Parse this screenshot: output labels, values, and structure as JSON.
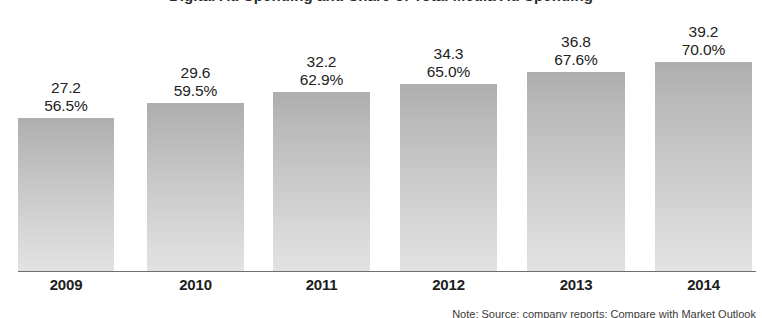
{
  "chart_data": {
    "type": "bar",
    "title": "Digital Ad Spending and Share of Total Media Ad Spending",
    "footnote": "Note: Source: company reports; Compare with Market Outlook",
    "categories": [
      "2009",
      "2010",
      "2011",
      "2012",
      "2013",
      "2014"
    ],
    "series": [
      {
        "name": "Spending",
        "values": [
          27.2,
          29.6,
          32.2,
          34.3,
          36.8,
          39.2
        ]
      },
      {
        "name": "Share of total",
        "values": [
          56.5,
          59.5,
          62.9,
          65.0,
          67.6,
          70.0
        ]
      }
    ],
    "value_labels": [
      "27.2",
      "29.6",
      "32.2",
      "34.3",
      "36.8",
      "39.2"
    ],
    "percent_labels": [
      "56.5%",
      "59.5%",
      "62.9%",
      "65.0%",
      "67.6%",
      "70.0%"
    ],
    "xlabel": "",
    "ylabel": "",
    "ylim": [
      0,
      45
    ],
    "grid": false,
    "legend": "none",
    "colors": {
      "bar_top": "#aeaeae",
      "bar_bottom": "#e2e2e2",
      "axis": "#6f6f6f",
      "label_text": "#232323",
      "year_text": "#1d1d1d",
      "background": "#ffffff"
    }
  },
  "bars": [
    {
      "year": "2009",
      "value": "27.2",
      "percent": "56.5%",
      "x": 18,
      "width": 96,
      "top": 118
    },
    {
      "year": "2010",
      "value": "29.6",
      "percent": "59.5%",
      "x": 147,
      "width": 97,
      "top": 103
    },
    {
      "year": "2011",
      "value": "32.2",
      "percent": "62.9%",
      "x": 273,
      "width": 97,
      "top": 92
    },
    {
      "year": "2012",
      "value": "34.3",
      "percent": "65.0%",
      "x": 400,
      "width": 97,
      "top": 84
    },
    {
      "year": "2013",
      "value": "36.8",
      "percent": "67.6%",
      "x": 527,
      "width": 98,
      "top": 72
    },
    {
      "year": "2014",
      "value": "39.2",
      "percent": "70.0%",
      "x": 655,
      "width": 97,
      "top": 62
    }
  ]
}
